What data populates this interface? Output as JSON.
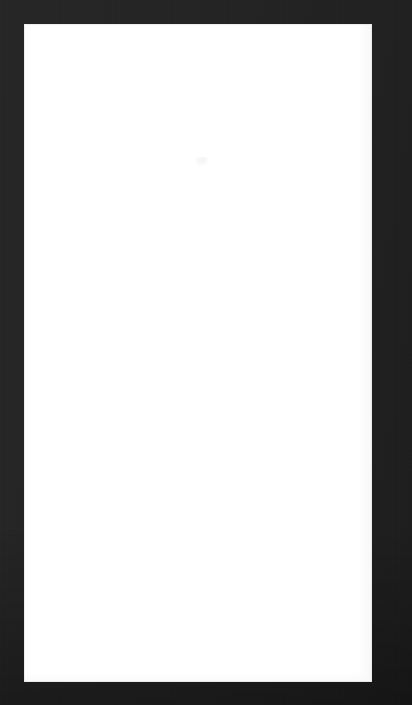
{
  "window": {
    "width": 412,
    "height": 705,
    "state": "blank",
    "title": "",
    "frame_color": "#242424",
    "frame_color_shadow": "#1d1d1d",
    "panel_color": "#ffffff"
  },
  "frame": {
    "name": "device-chrome",
    "description": "dark charcoal border surrounding the content panel",
    "inset": {
      "left": 24,
      "top": 24,
      "right": 40,
      "bottom": 23
    }
  },
  "content_panel": {
    "name": "content-panel",
    "x": 24,
    "y": 24,
    "width": 348,
    "height": 658,
    "background": "#ffffff",
    "is_empty": true,
    "text": "",
    "elements": []
  },
  "artifact": {
    "name": "render-speck",
    "x": 196,
    "y": 161,
    "note": "",
    "visible_text": ""
  }
}
